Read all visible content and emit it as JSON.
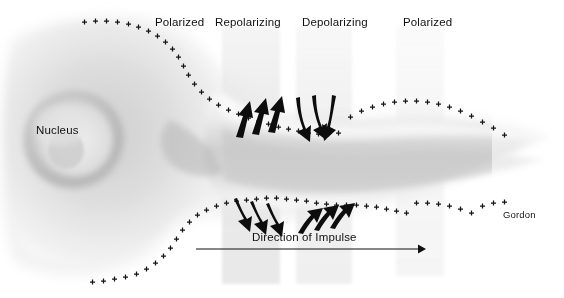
{
  "figure": {
    "signature": "Gordon",
    "background_color": "#ffffff",
    "ink_color": "#101010"
  },
  "zone_labels": [
    {
      "text": "Polarized",
      "x": 155,
      "y": 16
    },
    {
      "text": "Repolarizing",
      "x": 215,
      "y": 16
    },
    {
      "text": "Depolarizing",
      "x": 302,
      "y": 16
    },
    {
      "text": "Polarized",
      "x": 403,
      "y": 16
    }
  ],
  "structure_labels": [
    {
      "text": "Nucleus",
      "x": 36,
      "y": 124
    }
  ],
  "impulse": {
    "label": "Direction of Impulse",
    "label_x": 252,
    "label_y": 231,
    "arrow_x1": 196,
    "arrow_x2": 424,
    "arrow_y": 249
  },
  "membrane_charges": {
    "symbol": "+",
    "description": "small plus marks lining the outer membrane surface",
    "color": "#141414"
  },
  "ion_arrow_groups": [
    {
      "name": "repolarizing-efflux-upper",
      "direction": "up-right",
      "count": 3
    },
    {
      "name": "depolarizing-influx-upper",
      "direction": "down-left",
      "count": 3
    },
    {
      "name": "repolarizing-efflux-lower",
      "direction": "down-left",
      "count": 3
    },
    {
      "name": "depolarizing-influx-lower",
      "direction": "up-right",
      "count": 3
    }
  ],
  "shaded_bands": [
    {
      "name": "repolarizing-band",
      "x": 222,
      "width": 58,
      "shade": "#e9e9e9"
    },
    {
      "name": "depolarizing-band",
      "x": 296,
      "width": 56,
      "shade": "#ededed"
    },
    {
      "name": "polarized-right-band",
      "x": 396,
      "width": 48,
      "shade": "#f4f4f4"
    }
  ]
}
